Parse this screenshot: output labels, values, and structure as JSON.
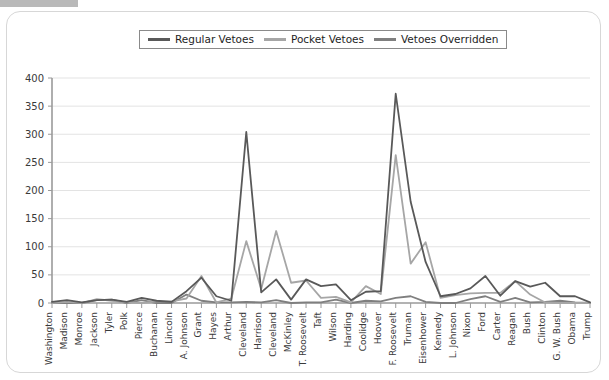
{
  "window": {
    "redacted_bar": ""
  },
  "legend": {
    "position": "top-center",
    "items": [
      {
        "label": "Regular Vetoes",
        "color": "#595959"
      },
      {
        "label": "Pocket Vetoes",
        "color": "#a6a6a6"
      },
      {
        "label": "Vetoes Overridden",
        "color": "#7f7f7f"
      }
    ]
  },
  "chart_data": {
    "type": "line",
    "title": "",
    "xlabel": "",
    "ylabel": "",
    "ylim": [
      0,
      400
    ],
    "yticks": [
      0,
      50,
      100,
      150,
      200,
      250,
      300,
      350,
      400
    ],
    "grid": true,
    "categories": [
      "Washington",
      "Madison",
      "Monroe",
      "Jackson",
      "Tyler",
      "Polk",
      "Pierce",
      "Buchanan",
      "Lincoln",
      "A. Johnson",
      "Grant",
      "Hayes",
      "Arthur",
      "Cleveland",
      "Harrison",
      "Cleveland",
      "McKinley",
      "T. Roosevelt",
      "Taft",
      "Wilson",
      "Harding",
      "Coolidge",
      "Hoover",
      "F. Roosevelt",
      "Truman",
      "Eisenhower",
      "Kennedy",
      "L. Johnson",
      "Nixon",
      "Ford",
      "Carter",
      "Reagan",
      "Bush",
      "Clinton",
      "G. W. Bush",
      "Obama",
      "Trump"
    ],
    "series": [
      {
        "name": "Regular Vetoes",
        "color": "#595959",
        "values": [
          2,
          5,
          1,
          5,
          6,
          2,
          9,
          4,
          2,
          21,
          45,
          12,
          4,
          304,
          19,
          42,
          6,
          42,
          30,
          33,
          5,
          20,
          21,
          372,
          180,
          73,
          12,
          16,
          26,
          48,
          13,
          39,
          29,
          36,
          12,
          12,
          1
        ]
      },
      {
        "name": "Pocket Vetoes",
        "color": "#a6a6a6",
        "values": [
          0,
          2,
          0,
          7,
          4,
          1,
          0,
          3,
          3,
          8,
          48,
          1,
          8,
          110,
          25,
          128,
          36,
          40,
          9,
          11,
          1,
          30,
          16,
          263,
          70,
          108,
          9,
          14,
          17,
          18,
          18,
          39,
          15,
          1,
          0,
          0,
          0
        ]
      },
      {
        "name": "Vetoes Overridden",
        "color": "#7f7f7f",
        "values": [
          0,
          0,
          0,
          5,
          6,
          0,
          5,
          0,
          0,
          15,
          4,
          1,
          1,
          2,
          1,
          5,
          0,
          1,
          1,
          6,
          0,
          4,
          3,
          9,
          12,
          2,
          0,
          0,
          7,
          12,
          2,
          9,
          1,
          2,
          4,
          1,
          0
        ]
      }
    ]
  }
}
